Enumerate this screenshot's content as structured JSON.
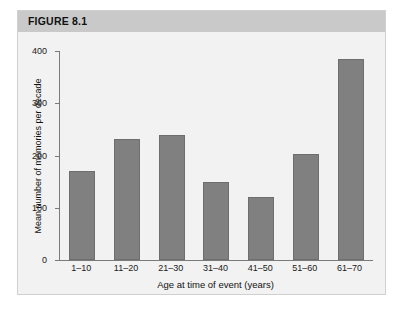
{
  "figure": {
    "header_label": "FIGURE 8.1"
  },
  "colors": {
    "bar_fill": "#808080",
    "bar_stroke": "#6e6e6e",
    "header_band": "#c9c9c9",
    "plot_background": "#f2f2f2",
    "axis_line": "#7a7a7a",
    "figure_border": "#d0d0d0"
  },
  "chart_data": {
    "type": "bar",
    "title": "FIGURE 8.1",
    "xlabel": "Age at time of event (years)",
    "ylabel": "Mean number of memories per decade",
    "categories": [
      "1–10",
      "11–20",
      "21–30",
      "31–40",
      "41–50",
      "51–60",
      "61–70"
    ],
    "values": [
      170,
      232,
      240,
      150,
      120,
      202,
      385
    ],
    "ylim": [
      0,
      400
    ],
    "yticks": [
      0,
      100,
      200,
      300,
      400
    ],
    "ytick_labels": [
      "0",
      "100",
      "200",
      "300",
      "400"
    ],
    "grid": false,
    "legend": null,
    "series": [
      {
        "name": "Mean number of memories per decade",
        "values": [
          170,
          232,
          240,
          150,
          120,
          202,
          385
        ]
      }
    ]
  }
}
